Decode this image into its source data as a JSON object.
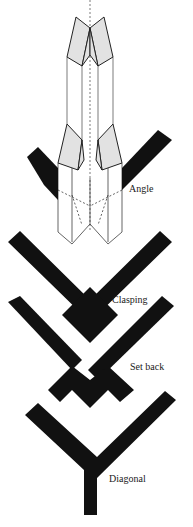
{
  "diagram": {
    "ink_color": "#111111",
    "fill_light": "#e2e2e2",
    "labels": {
      "angle": "Angle",
      "clasping": "Clasping",
      "set_back": "Set back",
      "diagonal": "Diagonal"
    },
    "figures": [
      {
        "id": "angle",
        "label": "Angle",
        "type": "isometric-and-plan"
      },
      {
        "id": "clasping",
        "label": "Clasping",
        "type": "plan"
      },
      {
        "id": "set_back",
        "label": "Set back",
        "type": "plan"
      },
      {
        "id": "diagonal",
        "label": "Diagonal",
        "type": "plan"
      }
    ]
  }
}
